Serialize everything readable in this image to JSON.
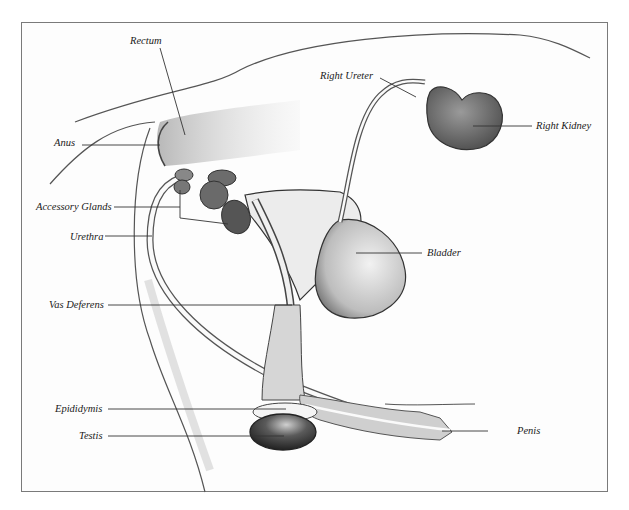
{
  "diagram": {
    "labels": {
      "rectum": "Rectum",
      "anus": "Anus",
      "accessory_glands": "Accessory Glands",
      "urethra": "Urethra",
      "vas_deferens": "Vas Deferens",
      "epididymis": "Epididymis",
      "testis": "Testis",
      "right_ureter": "Right Ureter",
      "right_kidney": "Right Kidney",
      "bladder": "Bladder",
      "penis": "Penis"
    },
    "colors": {
      "frame_border": "#7a7a7a",
      "outline": "#3a3a3a",
      "organ_dark": "#4a4a4a",
      "organ_mid": "#8a8a8a",
      "tissue_light": "#d8d8d8",
      "leader_line": "#333333"
    }
  }
}
